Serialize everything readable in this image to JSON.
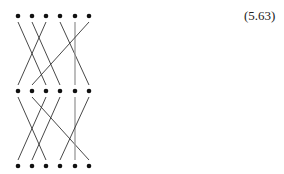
{
  "equation_label": "(5.63)",
  "colors": {
    "line": "#333333",
    "dot": "#111111",
    "vertical_line": "#999999"
  },
  "dot_x": [
    18,
    32,
    46,
    60,
    75,
    89
  ],
  "rows_y": [
    16,
    91,
    166
  ],
  "sections": [
    {
      "name": "upper",
      "from_row": 0,
      "to_row": 1,
      "connections": [
        [
          0,
          2
        ],
        [
          1,
          3
        ],
        [
          2,
          0
        ],
        [
          3,
          5
        ],
        [
          4,
          4
        ],
        [
          5,
          1
        ]
      ]
    },
    {
      "name": "lower",
      "from_row": 1,
      "to_row": 2,
      "connections": [
        [
          0,
          2
        ],
        [
          1,
          5
        ],
        [
          2,
          0
        ],
        [
          3,
          1
        ],
        [
          4,
          4
        ],
        [
          5,
          3
        ]
      ]
    }
  ]
}
